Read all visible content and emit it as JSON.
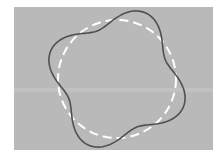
{
  "figure": {
    "canvas": {
      "width": 222,
      "height": 157,
      "background": "#ffffff"
    },
    "panel": {
      "x": 14,
      "y": 7,
      "width": 199,
      "height": 143,
      "fill": "#b9b9b9",
      "band_y": 90,
      "band_color": "#c4c4c4"
    },
    "reference_circle": {
      "cx": 117,
      "cy": 79,
      "r": 59,
      "stroke": "#ffffff",
      "stroke_width": 2,
      "dasharray": "9 5"
    },
    "wavy_curve": {
      "cx": 117,
      "cy": 79,
      "base_radius": 62,
      "amplitude": 10,
      "lobes": 4,
      "peak_angle_deg": -67,
      "stroke": "#505050",
      "stroke_width": 1.6
    }
  }
}
